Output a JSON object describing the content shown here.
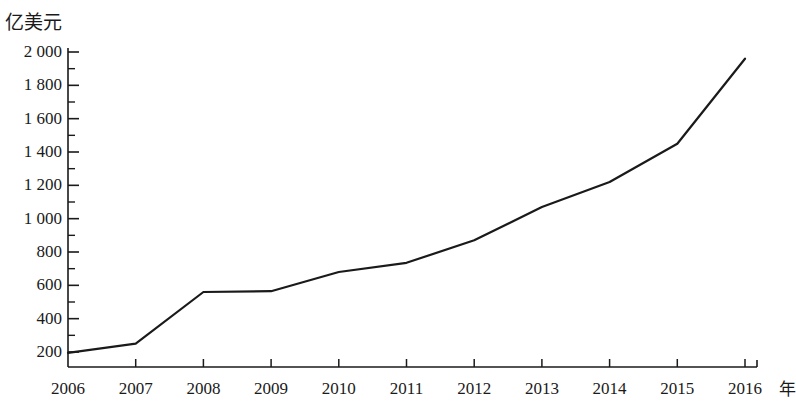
{
  "chart_data": {
    "type": "line",
    "title": "",
    "subtitle": "",
    "ylabel": "亿美元",
    "xlabel": "年",
    "categories": [
      "2006",
      "2007",
      "2008",
      "2009",
      "2010",
      "2011",
      "2012",
      "2013",
      "2014",
      "2015",
      "2016"
    ],
    "values": [
      195,
      250,
      560,
      565,
      680,
      735,
      870,
      1070,
      1220,
      1450,
      1960
    ],
    "series": [
      {
        "name": "亿美元",
        "values": [
          195,
          250,
          560,
          565,
          680,
          735,
          870,
          1070,
          1220,
          1450,
          1960
        ]
      }
    ],
    "ylim": [
      0,
      2060
    ],
    "xlim": [
      "2006",
      "2016"
    ],
    "y_major_ticks": [
      200,
      400,
      600,
      800,
      1000,
      1200,
      1400,
      1600,
      1800,
      2000
    ],
    "y_major_tick_labels": [
      "200",
      "400",
      "600",
      "800",
      "1 000",
      "1 200",
      "1 400",
      "1 600",
      "1 800",
      "2 000"
    ],
    "y_minor_tick_step": 100,
    "grid": false,
    "legend": false,
    "legend_position": "none",
    "line_color": "#1a1a1a",
    "markers": false,
    "annotations": []
  },
  "axes": {
    "y_title": "亿美元",
    "x_title": "年",
    "y_labels": [
      "2 000",
      "1 800",
      "1 600",
      "1 400",
      "1 200",
      "1 000",
      "800",
      "600",
      "400",
      "200"
    ],
    "x_labels": [
      "2006",
      "2007",
      "2008",
      "2009",
      "2010",
      "2011",
      "2012",
      "2013",
      "2014",
      "2015",
      "2016"
    ]
  },
  "colors": {
    "line": "#1a1a1a",
    "axis": "#1a1a1a",
    "text": "#1a1a1a",
    "background": "#ffffff"
  }
}
